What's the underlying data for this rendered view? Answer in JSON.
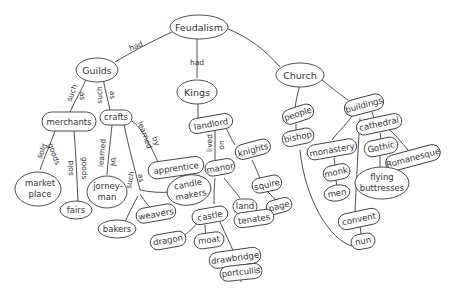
{
  "title": "Feudalism",
  "colors": {
    "line": "#3a3a3a",
    "text": "#333333",
    "background": "#ffffff"
  },
  "nodes": {
    "feudalism": "Feudalism",
    "guilds": "Guilds",
    "kings": "Kings",
    "church": "Church",
    "merchants": "merchants",
    "crafts": "crafts",
    "market_place_1": "market",
    "market_place_2": "place",
    "fairs": "fairs",
    "jorneyman_1": "jorney-",
    "jorneyman_2": "man",
    "apprentice": "apprentice",
    "candle_makers_1": "candle",
    "candle_makers_2": "makers",
    "weavers": "weavers",
    "bakers": "bakers",
    "landlord": "landlord",
    "knights": "knights",
    "manor": "manor",
    "squire": "squire",
    "page": "page",
    "castle": "castle",
    "land": "land",
    "tenates": "tenates",
    "dragon": "dragon",
    "moat": "moat",
    "drawbridge": "drawbridge",
    "portcullis": "portcullis",
    "people": "people",
    "bishop": "bishop",
    "buildings": "buildings",
    "cathedral": "cathedral",
    "monastery": "monastery",
    "gothic": "Gothic",
    "romanesque": "Romanesque",
    "monk": "monk",
    "men": "men",
    "flying_buttresses_1": "flying",
    "flying_buttresses_2": "buttresses",
    "convent": "convent",
    "nun": "nun"
  },
  "links": {
    "feudalism_guilds": "had",
    "feudalism_kings": "had",
    "guilds_merchants_1": "such",
    "guilds_merchants_2": "as",
    "guilds_crafts_1": "such",
    "guilds_crafts_2": "as",
    "merchants_market_1": "sold",
    "merchants_market_2": "goods",
    "merchants_fairs_1": "sold",
    "merchants_fairs_2": "goods",
    "crafts_jorneyman_1": "learned",
    "crafts_jorneyman_2": "by",
    "crafts_apprentice_1": "learned",
    "crafts_apprentice_2": "by",
    "crafts_such_1": "such",
    "crafts_such_2": "as",
    "landlord_manor_1": "lived",
    "landlord_manor_2": "on"
  }
}
